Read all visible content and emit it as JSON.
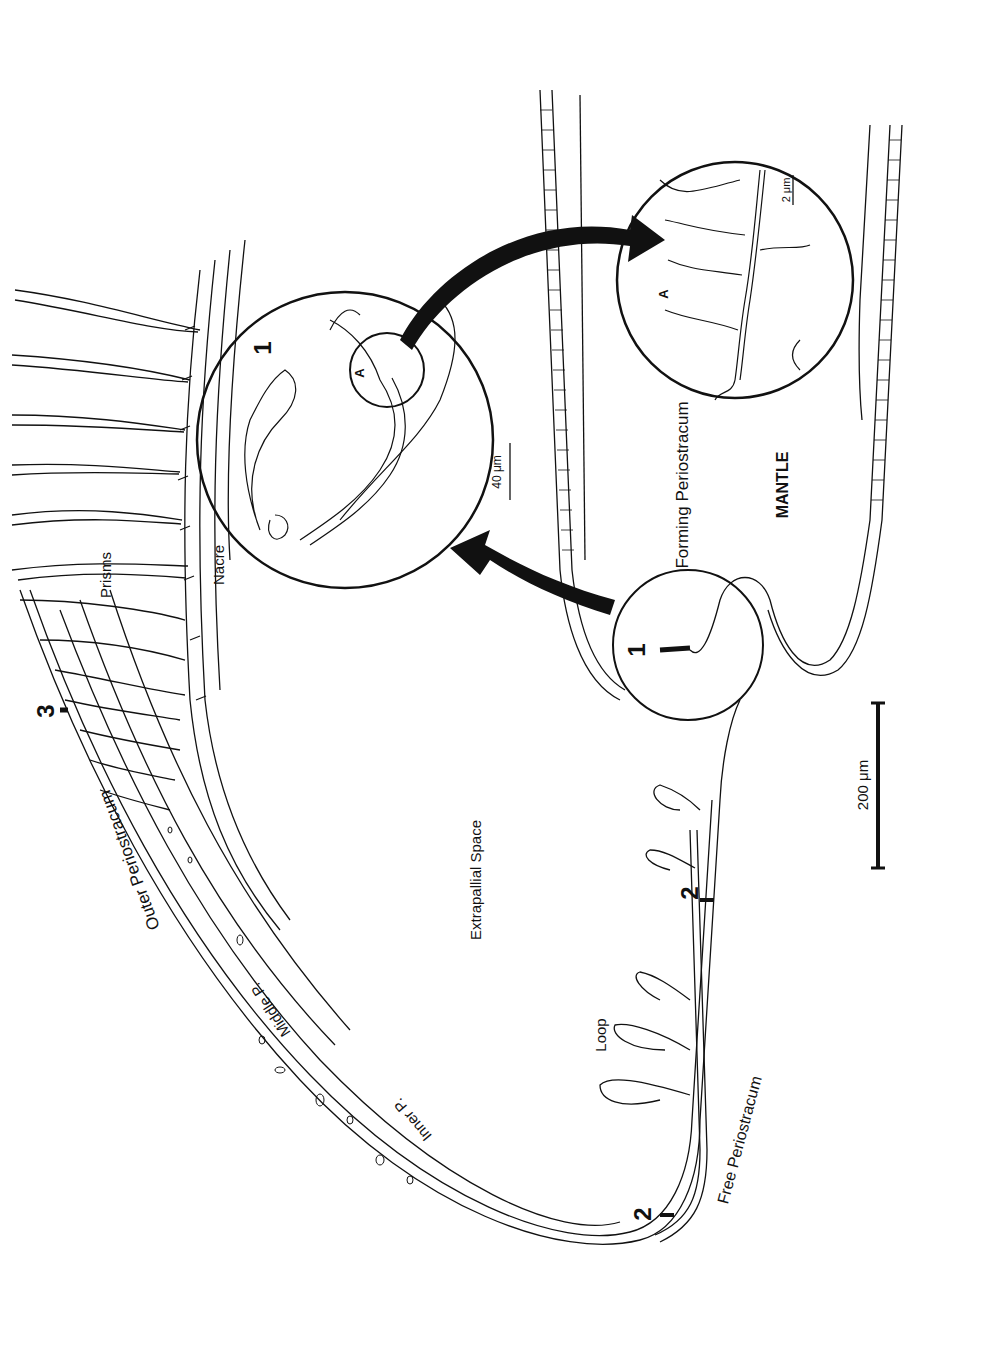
{
  "figure": {
    "orientation": "rotated -90deg (text reads bottom-to-top)",
    "labels": {
      "prisms": "Prisms",
      "nacre": "Nacre",
      "outer_periostracum": "Outer Periostracum",
      "middle_p": "Middle P.",
      "inner_p": "Inner P.",
      "extrapallial_space": "Extrapallial Space",
      "loop": "Loop",
      "free_periostracum": "Free Periostracum",
      "forming_periostracum": "Forming Periostracum",
      "mantle": "MANTLE"
    },
    "markers": {
      "marker_3": "3",
      "marker_2_upper": "2",
      "marker_2_lower": "2",
      "marker_1_small_circle": "1",
      "marker_1_large_inset": "1",
      "marker_a_inset": "A",
      "marker_a_detail": "A"
    },
    "scale_bars": {
      "main": "200 μm",
      "inset_1": "40 μm",
      "inset_a": "2 μm"
    },
    "colors": {
      "ink": "#111111",
      "background": "#ffffff"
    }
  }
}
